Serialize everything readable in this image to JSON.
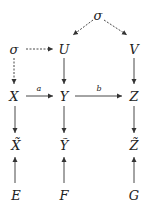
{
  "diagram": {
    "nodes": {
      "sigma_top": {
        "label": "σ",
        "x": 98,
        "y": 15
      },
      "sigma_left": {
        "label": "σ",
        "x": 14,
        "y": 49
      },
      "U": {
        "label": "U",
        "x": 64,
        "y": 49
      },
      "V": {
        "label": "V",
        "x": 134,
        "y": 49
      },
      "X": {
        "label": "X",
        "x": 14,
        "y": 96
      },
      "Y": {
        "label": "Y",
        "x": 64,
        "y": 96
      },
      "Z": {
        "label": "Z",
        "x": 134,
        "y": 96
      },
      "X_tilde": {
        "label": "X̃",
        "x": 16,
        "y": 145
      },
      "Y_tilde": {
        "label": "Ỹ",
        "x": 64,
        "y": 145
      },
      "Z_tilde": {
        "label": "Z̃",
        "x": 134,
        "y": 145
      },
      "E": {
        "label": "E",
        "x": 16,
        "y": 195
      },
      "F": {
        "label": "F",
        "x": 64,
        "y": 195
      },
      "G": {
        "label": "G",
        "x": 134,
        "y": 195
      }
    },
    "edges": [
      {
        "from": "sigma_top",
        "to": "U",
        "style": "dashed"
      },
      {
        "from": "sigma_top",
        "to": "V",
        "style": "dashed"
      },
      {
        "from": "sigma_left",
        "to": "U",
        "style": "dashed"
      },
      {
        "from": "sigma_left",
        "to": "X",
        "style": "dashed"
      },
      {
        "from": "U",
        "to": "Y",
        "style": "solid"
      },
      {
        "from": "V",
        "to": "Z",
        "style": "solid"
      },
      {
        "from": "X",
        "to": "Y",
        "style": "solid",
        "label": "a"
      },
      {
        "from": "Y",
        "to": "Z",
        "style": "solid",
        "label": "b"
      },
      {
        "from": "X",
        "to": "X_tilde",
        "style": "solid"
      },
      {
        "from": "Y",
        "to": "Y_tilde",
        "style": "solid"
      },
      {
        "from": "Z",
        "to": "Z_tilde",
        "style": "solid"
      },
      {
        "from": "E",
        "to": "X_tilde",
        "style": "solid"
      },
      {
        "from": "F",
        "to": "Y_tilde",
        "style": "solid"
      },
      {
        "from": "G",
        "to": "Z_tilde",
        "style": "solid"
      }
    ],
    "edge_labels": {
      "a": {
        "label": "a",
        "x": 39,
        "y": 89
      },
      "b": {
        "label": "b",
        "x": 99,
        "y": 89
      }
    },
    "colors": {
      "stroke": "#333333",
      "text": "#222222",
      "background": "#ffffff"
    }
  }
}
